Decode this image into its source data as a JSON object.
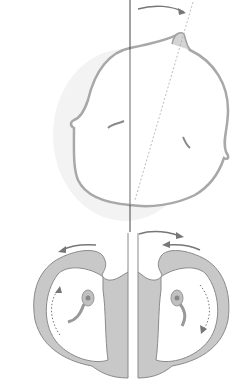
{
  "diagram": {
    "colors": {
      "fill": "#c8c8c8",
      "outline": "#8a8a8a",
      "arrow": "#6e6e6e",
      "axis": "#444444",
      "background": "#ffffff"
    },
    "labels": []
  }
}
